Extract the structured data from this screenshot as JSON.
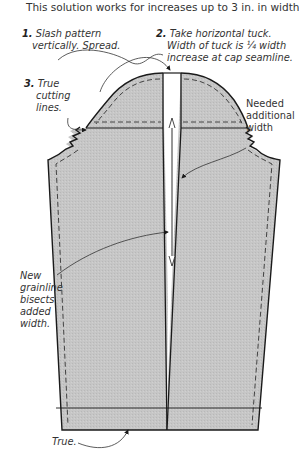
{
  "header": {
    "title_cut": "Expand Sleeve Pattern for Large Upper Arm",
    "subtitle": "This solution works for increases up to 3 in. in width."
  },
  "annotations": {
    "step1": {
      "num": "1.",
      "line1": "Slash pattern",
      "line2": "vertically. Spread."
    },
    "step2": {
      "num": "2.",
      "line1": "Take horizontal tuck.",
      "line2": "Width of tuck is ¼ width",
      "line3": "increase at cap seamline."
    },
    "step3": {
      "num": "3.",
      "line1": "True",
      "line2": "cutting",
      "line3": "lines."
    },
    "needed": {
      "line1": "Needed",
      "line2": "additional",
      "line3": "width"
    },
    "grainline": {
      "line1": "New",
      "line2": "grainline",
      "line3": "bisects",
      "line4": "added",
      "line5": "width."
    },
    "true_hem": {
      "label": "True."
    }
  },
  "colors": {
    "fabric": "#c4c4c4",
    "outline": "#1a1a1a",
    "text": "#333333",
    "background": "#ffffff"
  }
}
